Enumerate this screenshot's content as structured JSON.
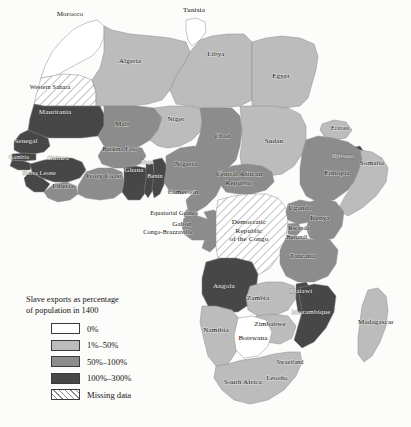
{
  "figure": {
    "type": "choropleth-map",
    "region": "Africa",
    "background_color": "#fcfcfb",
    "border_color": "#8d8d8d"
  },
  "legend": {
    "title": "Slave exports as percentage\nof population in 1400",
    "items": [
      {
        "label": "0%",
        "color": "#ffffff",
        "pattern": "solid"
      },
      {
        "label": "1%–50%",
        "color": "#bcbcbc",
        "pattern": "solid"
      },
      {
        "label": "50%–100%",
        "color": "#8c8c8c",
        "pattern": "solid"
      },
      {
        "label": "100%–300%",
        "color": "#474747",
        "pattern": "solid"
      },
      {
        "label": "Missing data",
        "color": "#ffffff",
        "pattern": "hatch"
      }
    ]
  },
  "chart_data": {
    "type": "map",
    "title": "Slave exports as percentage of population in 1400",
    "categories": [
      "0%",
      "1%-50%",
      "50%-100%",
      "100%-300%",
      "Missing data"
    ],
    "colors": [
      "#ffffff",
      "#bcbcbc",
      "#8c8c8c",
      "#474747",
      "hatch"
    ],
    "features": [
      {
        "name": "Morocco",
        "label": "Morocco",
        "x": 70,
        "y": 16,
        "class": "c0"
      },
      {
        "name": "Tunisia",
        "label": "Tunisia",
        "x": 194,
        "y": 12,
        "class": "c0"
      },
      {
        "name": "Algeria",
        "label": "Algeria",
        "x": 130,
        "y": 63,
        "class": "c1"
      },
      {
        "name": "Libya",
        "label": "Libya",
        "x": 216,
        "y": 56,
        "class": "c1"
      },
      {
        "name": "Egypt",
        "label": "Egypt",
        "x": 281,
        "y": 78,
        "class": "c1"
      },
      {
        "name": "Western Sahara",
        "label": "Western Sahara",
        "x": 50,
        "y": 89,
        "class": "cm"
      },
      {
        "name": "Mauritania",
        "label": "Mauritania",
        "x": 55,
        "y": 114,
        "class": "c3"
      },
      {
        "name": "Mali",
        "label": "Mali",
        "x": 122,
        "y": 126,
        "class": "c2"
      },
      {
        "name": "Niger",
        "label": "Niger",
        "x": 176,
        "y": 121,
        "class": "c1"
      },
      {
        "name": "Chad",
        "label": "Chad",
        "x": 222,
        "y": 138,
        "class": "c2"
      },
      {
        "name": "Sudan",
        "label": "Sudan",
        "x": 274,
        "y": 143,
        "class": "c1"
      },
      {
        "name": "Eritrea",
        "label": "Eritrea",
        "x": 340,
        "y": 130,
        "class": "c1"
      },
      {
        "name": "Djibouti",
        "label": "Djibouti",
        "x": 343,
        "y": 158,
        "class": "c3"
      },
      {
        "name": "Somalia",
        "label": "Somalia",
        "x": 372,
        "y": 165,
        "class": "c1"
      },
      {
        "name": "Ethiopia",
        "label": "Ethiopia",
        "x": 337,
        "y": 175,
        "class": "c2"
      },
      {
        "name": "Senegal",
        "label": "Senegal",
        "x": 26,
        "y": 143,
        "class": "c3"
      },
      {
        "name": "Gambia",
        "label": "Gambia",
        "x": 19,
        "y": 159,
        "class": "c3"
      },
      {
        "name": "Guinea",
        "label": "Guinea",
        "x": 58,
        "y": 160,
        "class": "c3"
      },
      {
        "name": "Sierra Leone",
        "label": "Sierra Leone",
        "x": 39,
        "y": 175,
        "class": "c3"
      },
      {
        "name": "Liberia",
        "label": "Liberia",
        "x": 63,
        "y": 188,
        "class": "c2"
      },
      {
        "name": "Ivory Coast",
        "label": "Ivory Coast",
        "x": 104,
        "y": 178,
        "class": "c2"
      },
      {
        "name": "Burkina Faso",
        "label": "Burkina Faso",
        "x": 120,
        "y": 151,
        "class": "c2"
      },
      {
        "name": "Ghana",
        "label": "Ghana",
        "x": 134,
        "y": 172,
        "class": "c3"
      },
      {
        "name": "Togo",
        "label": "Togo",
        "x": 147,
        "y": 164,
        "class": "c3"
      },
      {
        "name": "Benin",
        "label": "Benin",
        "x": 155,
        "y": 178,
        "class": "c3"
      },
      {
        "name": "Nigeria",
        "label": "Nigeria",
        "x": 186,
        "y": 166,
        "class": "c2"
      },
      {
        "name": "Cameroon",
        "label": "Cameroon",
        "x": 183,
        "y": 194,
        "class": "c2"
      },
      {
        "name": "Central African Republic",
        "label": "Central African\nRepublic",
        "x": 239,
        "y": 176,
        "class": "c2"
      },
      {
        "name": "Equatorial Guinea",
        "label": "Equatorial Guinea",
        "x": 174,
        "y": 215,
        "class": "c2"
      },
      {
        "name": "Gabon",
        "label": "Gabon",
        "x": 182,
        "y": 226,
        "class": "c2"
      },
      {
        "name": "Congo-Brazzaville",
        "label": "Congo-Brazzaville",
        "x": 168,
        "y": 234,
        "class": "c2"
      },
      {
        "name": "Democratic Republic of the Congo",
        "label": "Democratic\nRepublic\nof the Congo",
        "x": 249,
        "y": 224,
        "class": "cm"
      },
      {
        "name": "Uganda",
        "label": "Uganda",
        "x": 300,
        "y": 210,
        "class": "c2"
      },
      {
        "name": "Kenya",
        "label": "Kenya",
        "x": 320,
        "y": 220,
        "class": "c2"
      },
      {
        "name": "Rwanda",
        "label": "Rwanda",
        "x": 299,
        "y": 230,
        "class": "c2"
      },
      {
        "name": "Burundi",
        "label": "Burundi",
        "x": 297,
        "y": 239,
        "class": "c2"
      },
      {
        "name": "Tanzania",
        "label": "Tanzania",
        "x": 303,
        "y": 258,
        "class": "c2"
      },
      {
        "name": "Angola",
        "label": "Angola",
        "x": 224,
        "y": 288,
        "class": "c3"
      },
      {
        "name": "Zambia",
        "label": "Zambia",
        "x": 258,
        "y": 300,
        "class": "c1"
      },
      {
        "name": "Malawi",
        "label": "Malawi",
        "x": 301,
        "y": 293,
        "class": "c3"
      },
      {
        "name": "Mozambique",
        "label": "Mozambique",
        "x": 311,
        "y": 314,
        "class": "c3"
      },
      {
        "name": "Zimbabwe",
        "label": "Zimbabwe",
        "x": 270,
        "y": 326,
        "class": "c1"
      },
      {
        "name": "Namibia",
        "label": "Namibia",
        "x": 216,
        "y": 332,
        "class": "c1"
      },
      {
        "name": "Botswana",
        "label": "Botswana",
        "x": 253,
        "y": 340,
        "class": "c0"
      },
      {
        "name": "Swaziland",
        "label": "Swaziland",
        "x": 290,
        "y": 364,
        "class": "c0"
      },
      {
        "name": "Lesotho",
        "label": "Lesotho",
        "x": 277,
        "y": 380,
        "class": "c0"
      },
      {
        "name": "South Africa",
        "label": "South Africa",
        "x": 243,
        "y": 384,
        "class": "c1"
      },
      {
        "name": "Madagascar",
        "label": "Madagascar",
        "x": 376,
        "y": 324,
        "class": "c1"
      }
    ]
  }
}
